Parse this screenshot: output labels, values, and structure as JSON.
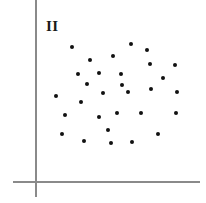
{
  "chart_data": {
    "type": "scatter",
    "title": "",
    "subtitle": "",
    "xlabel": "",
    "ylabel": "",
    "annotations": [
      {
        "name": "quadrant-label",
        "text": "II",
        "x": 46,
        "y": 19
      }
    ],
    "legend": [],
    "legend_position": "none",
    "grid": false,
    "axes": {
      "style": "cartesian-corner",
      "color": "#8a8a8a",
      "line_width_px": 2,
      "origin": {
        "x": 36,
        "y": 182
      },
      "vertical": {
        "x": 36,
        "y_top": 0,
        "y_bottom": 197
      },
      "horizontal": {
        "y": 182,
        "x_left": 13,
        "x_right": 200
      },
      "tick_labels_x": [],
      "tick_labels_y": [],
      "xlim": [
        0,
        206
      ],
      "ylim": [
        0,
        203
      ]
    },
    "point_style": {
      "color": "#111111",
      "diameter_px": 4,
      "marker": "circle"
    },
    "n_points": 30,
    "points": [
      {
        "x": 72,
        "y": 47
      },
      {
        "x": 131,
        "y": 44
      },
      {
        "x": 113,
        "y": 56
      },
      {
        "x": 150,
        "y": 64
      },
      {
        "x": 175,
        "y": 65
      },
      {
        "x": 78,
        "y": 74
      },
      {
        "x": 99,
        "y": 73
      },
      {
        "x": 121,
        "y": 74
      },
      {
        "x": 87,
        "y": 84
      },
      {
        "x": 122,
        "y": 85
      },
      {
        "x": 151,
        "y": 89
      },
      {
        "x": 103,
        "y": 93
      },
      {
        "x": 128,
        "y": 92
      },
      {
        "x": 177,
        "y": 92
      },
      {
        "x": 81,
        "y": 102
      },
      {
        "x": 65,
        "y": 115
      },
      {
        "x": 99,
        "y": 117
      },
      {
        "x": 117,
        "y": 113
      },
      {
        "x": 141,
        "y": 113
      },
      {
        "x": 176,
        "y": 113
      },
      {
        "x": 62,
        "y": 134
      },
      {
        "x": 158,
        "y": 134
      },
      {
        "x": 84,
        "y": 141
      },
      {
        "x": 111,
        "y": 143
      },
      {
        "x": 132,
        "y": 142
      },
      {
        "x": 56,
        "y": 96
      },
      {
        "x": 147,
        "y": 50
      },
      {
        "x": 90,
        "y": 60
      },
      {
        "x": 163,
        "y": 78
      },
      {
        "x": 108,
        "y": 130
      }
    ]
  }
}
